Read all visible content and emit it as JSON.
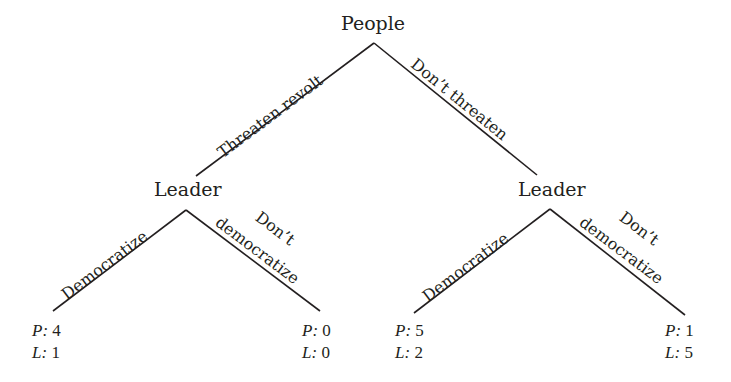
{
  "diagram": {
    "type": "extensive-form game tree",
    "line_color": "#231f20",
    "text_color": "#231f20",
    "root": {
      "label": "People",
      "actions": [
        "Threaten revolt",
        "Don’t threaten"
      ]
    },
    "left_node": {
      "label": "Leader",
      "parent_action": "Threaten revolt",
      "actions": {
        "democratize": "Democratize",
        "dont_line1": "Don’t",
        "dont_line2": "democratize"
      }
    },
    "right_node": {
      "label": "Leader",
      "parent_action": "Don’t threaten",
      "actions": {
        "democratize": "Democratize",
        "dont_line1": "Don’t",
        "dont_line2": "democratize"
      }
    },
    "payoffs": [
      {
        "path": "Threaten revolt / Democratize",
        "p_label": "P:",
        "p": "4",
        "l_label": "L:",
        "l": "1"
      },
      {
        "path": "Threaten revolt / Don't democratize",
        "p_label": "P:",
        "p": "0",
        "l_label": "L:",
        "l": "0"
      },
      {
        "path": "Don't threaten / Democratize",
        "p_label": "P:",
        "p": "5",
        "l_label": "L:",
        "l": "2"
      },
      {
        "path": "Don't threaten / Don't democratize",
        "p_label": "P:",
        "p": "1",
        "l_label": "L:",
        "l": "5"
      }
    ]
  }
}
